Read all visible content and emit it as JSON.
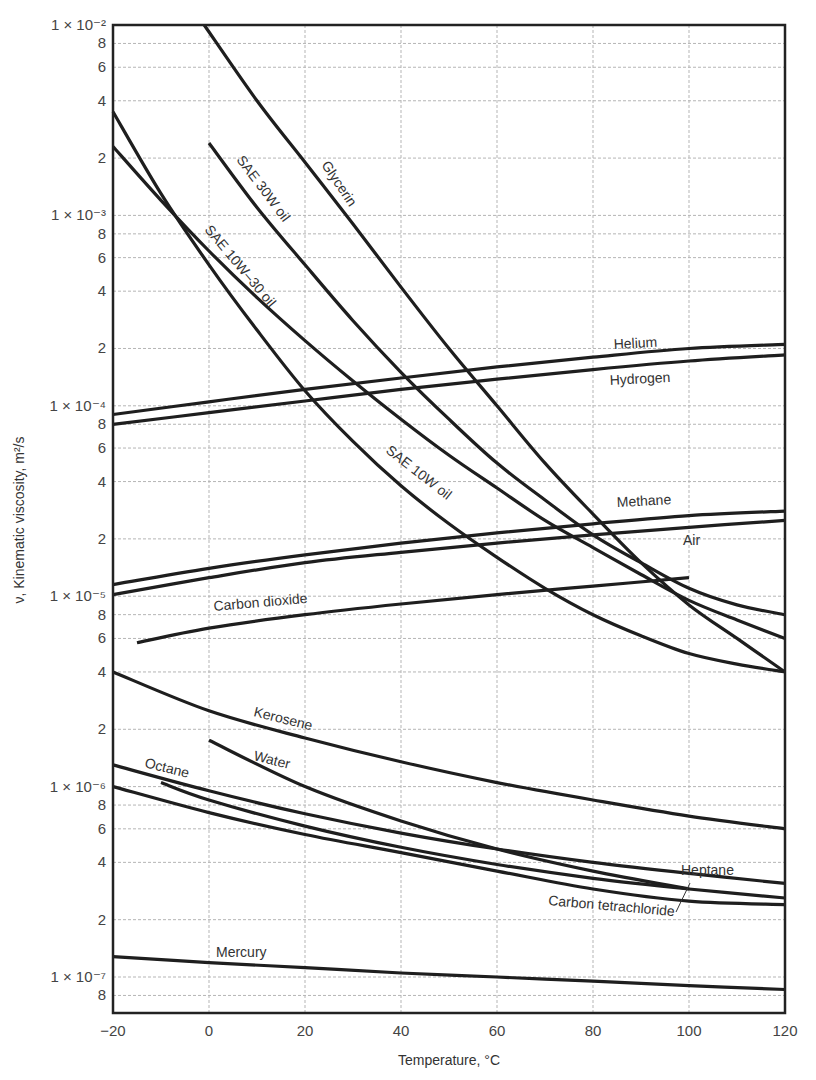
{
  "chart_data": {
    "type": "line",
    "title": "",
    "xlabel": "Temperature, °C",
    "ylabel": "ν, Kinematic viscosity, m²/s",
    "yscale": "log",
    "xlim": [
      -20,
      120
    ],
    "ylim": [
      7e-08,
      0.01
    ],
    "grid": true,
    "legend": "inline labels",
    "x_ticks": [
      -20,
      0,
      20,
      40,
      60,
      80,
      100,
      120
    ],
    "y_ticks": [
      {
        "value": 0.01,
        "label": "1 × 10⁻²"
      },
      {
        "value": 0.008,
        "label": "8"
      },
      {
        "value": 0.006,
        "label": "6"
      },
      {
        "value": 0.004,
        "label": "4"
      },
      {
        "value": 0.002,
        "label": "2"
      },
      {
        "value": 0.001,
        "label": "1 × 10⁻³"
      },
      {
        "value": 0.0008,
        "label": "8"
      },
      {
        "value": 0.0006,
        "label": "6"
      },
      {
        "value": 0.0004,
        "label": "4"
      },
      {
        "value": 0.0002,
        "label": "2"
      },
      {
        "value": 0.0001,
        "label": "1 × 10⁻⁴"
      },
      {
        "value": 8e-05,
        "label": "8"
      },
      {
        "value": 6e-05,
        "label": "6"
      },
      {
        "value": 4e-05,
        "label": "4"
      },
      {
        "value": 2e-05,
        "label": "2"
      },
      {
        "value": 1e-05,
        "label": "1 × 10⁻⁵"
      },
      {
        "value": 8e-06,
        "label": "8"
      },
      {
        "value": 6e-06,
        "label": "6"
      },
      {
        "value": 4e-06,
        "label": "4"
      },
      {
        "value": 2e-06,
        "label": "2"
      },
      {
        "value": 1e-06,
        "label": "1 × 10⁻⁶"
      },
      {
        "value": 8e-07,
        "label": "8"
      },
      {
        "value": 6e-07,
        "label": "6"
      },
      {
        "value": 4e-07,
        "label": "4"
      },
      {
        "value": 2e-07,
        "label": "2"
      },
      {
        "value": 1e-07,
        "label": "1 × 10⁻⁷"
      },
      {
        "value": 8e-08,
        "label": "8"
      }
    ],
    "series": [
      {
        "name": "Glycerin",
        "x": [
          -1,
          10,
          20,
          30,
          40,
          50,
          60,
          70,
          80,
          90,
          100,
          110,
          120
        ],
        "y": [
          0.01,
          0.004,
          0.0019,
          0.0009,
          0.00042,
          0.0002,
          0.0001,
          5e-05,
          2.7e-05,
          1.5e-05,
          9e-06,
          6e-06,
          4e-06
        ]
      },
      {
        "name": "SAE 30W oil",
        "x": [
          0,
          10,
          20,
          30,
          40,
          50,
          60,
          70,
          80,
          90,
          100,
          110,
          120
        ],
        "y": [
          0.0024,
          0.0011,
          0.00055,
          0.00028,
          0.00015,
          8.5e-05,
          5e-05,
          3.2e-05,
          2.1e-05,
          1.5e-05,
          1.1e-05,
          9e-06,
          8e-06
        ]
      },
      {
        "name": "SAE 10W-30 oil",
        "x": [
          -20,
          -10,
          0,
          10,
          20,
          30,
          40,
          50,
          60,
          70,
          80,
          90,
          100,
          110,
          120
        ],
        "y": [
          0.0023,
          0.0012,
          0.00065,
          0.00037,
          0.00022,
          0.000135,
          8.5e-05,
          5.5e-05,
          3.7e-05,
          2.5e-05,
          1.8e-05,
          1.3e-05,
          9.5e-06,
          7.5e-06,
          6e-06
        ]
      },
      {
        "name": "SAE 10W oil",
        "x": [
          -20,
          -10,
          0,
          10,
          20,
          30,
          40,
          50,
          60,
          70,
          80,
          90,
          100,
          110,
          120
        ],
        "y": [
          0.0035,
          0.0013,
          0.00055,
          0.00025,
          0.00012,
          6.5e-05,
          3.8e-05,
          2.4e-05,
          1.6e-05,
          1.1e-05,
          8e-06,
          6.2e-06,
          5e-06,
          4.4e-06,
          4e-06
        ]
      },
      {
        "name": "Helium",
        "x": [
          -20,
          0,
          20,
          40,
          60,
          80,
          100,
          120
        ],
        "y": [
          9e-05,
          0.000105,
          0.000122,
          0.00014,
          0.00016,
          0.00018,
          0.0002,
          0.00021
        ]
      },
      {
        "name": "Hydrogen",
        "x": [
          -20,
          0,
          20,
          40,
          60,
          80,
          100,
          120
        ],
        "y": [
          8e-05,
          9.2e-05,
          0.000106,
          0.000122,
          0.000138,
          0.000155,
          0.000172,
          0.000185
        ]
      },
      {
        "name": "Methane",
        "x": [
          -20,
          0,
          20,
          40,
          60,
          80,
          100,
          120
        ],
        "y": [
          1.15e-05,
          1.4e-05,
          1.65e-05,
          1.9e-05,
          2.15e-05,
          2.4e-05,
          2.65e-05,
          2.8e-05
        ]
      },
      {
        "name": "Air",
        "x": [
          -20,
          0,
          20,
          40,
          60,
          80,
          100,
          120
        ],
        "y": [
          1.02e-05,
          1.25e-05,
          1.5e-05,
          1.7e-05,
          1.9e-05,
          2.1e-05,
          2.3e-05,
          2.5e-05
        ]
      },
      {
        "name": "Carbon dioxide",
        "x": [
          -15,
          0,
          20,
          40,
          60,
          80,
          100
        ],
        "y": [
          5.7e-06,
          6.8e-06,
          8e-06,
          9.1e-06,
          1.02e-05,
          1.13e-05,
          1.25e-05
        ]
      },
      {
        "name": "Kerosene",
        "x": [
          -20,
          0,
          20,
          40,
          60,
          80,
          100,
          120
        ],
        "y": [
          4e-06,
          2.5e-06,
          1.8e-06,
          1.35e-06,
          1.05e-06,
          8.5e-07,
          7e-07,
          6e-07
        ]
      },
      {
        "name": "Water",
        "x": [
          0,
          20,
          40,
          60,
          80,
          100
        ],
        "y": [
          1.75e-06,
          1e-06,
          6.6e-07,
          4.7e-07,
          3.6e-07,
          2.9e-07
        ]
      },
      {
        "name": "Octane",
        "x": [
          -20,
          0,
          20,
          40,
          60,
          80,
          100,
          120
        ],
        "y": [
          1.3e-06,
          9.5e-07,
          7.2e-07,
          5.7e-07,
          4.7e-07,
          4e-07,
          3.5e-07,
          3.1e-07
        ]
      },
      {
        "name": "Heptane",
        "x": [
          -10,
          0,
          20,
          40,
          60,
          80,
          100,
          120
        ],
        "y": [
          1.05e-06,
          8.5e-07,
          6.2e-07,
          4.8e-07,
          3.9e-07,
          3.3e-07,
          2.9e-07,
          2.6e-07
        ]
      },
      {
        "name": "Carbon tetrachloride",
        "x": [
          -20,
          0,
          20,
          40,
          60,
          80,
          100,
          120
        ],
        "y": [
          1e-06,
          7.3e-07,
          5.6e-07,
          4.5e-07,
          3.6e-07,
          2.9e-07,
          2.5e-07,
          2.4e-07
        ]
      },
      {
        "name": "Mercury",
        "x": [
          -20,
          0,
          20,
          40,
          60,
          80,
          100,
          120
        ],
        "y": [
          1.28e-07,
          1.19e-07,
          1.12e-07,
          1.05e-07,
          1e-07,
          9.5e-08,
          9e-08,
          8.6e-08
        ]
      }
    ],
    "annotations": [
      {
        "text": "Glycerin",
        "x": 321,
        "y": 165,
        "rotate": 56
      },
      {
        "text": "SAE 30W oil",
        "x": 236,
        "y": 160,
        "rotate": 53
      },
      {
        "text": "SAE 10W–30 oil",
        "x": 204,
        "y": 230,
        "rotate": 50
      },
      {
        "text": "SAE 10W oil",
        "x": 385,
        "y": 452,
        "rotate": 38
      },
      {
        "text": "Helium",
        "x": 614,
        "y": 349,
        "rotate": -3
      },
      {
        "text": "Hydrogen",
        "x": 610,
        "y": 385,
        "rotate": -3
      },
      {
        "text": "Methane",
        "x": 617,
        "y": 507,
        "rotate": -3
      },
      {
        "text": "Air",
        "x": 683,
        "y": 545,
        "rotate": 0
      },
      {
        "text": "Carbon dioxide",
        "x": 214,
        "y": 611,
        "rotate": -5
      },
      {
        "text": "Kerosene",
        "x": 253,
        "y": 716,
        "rotate": 14
      },
      {
        "text": "Water",
        "x": 253,
        "y": 760,
        "rotate": 14
      },
      {
        "text": "Octane",
        "x": 144,
        "y": 767,
        "rotate": 14
      },
      {
        "text": "Heptane",
        "x": 681,
        "y": 875,
        "rotate": 0
      },
      {
        "text": "Carbon tetrachloride",
        "x": 548,
        "y": 905,
        "rotate": 5
      },
      {
        "text": "Mercury",
        "x": 216,
        "y": 957,
        "rotate": 0
      }
    ]
  },
  "axes": {
    "x_title": "Temperature, °C",
    "y_title": "ν, Kinematic viscosity, m²/s"
  }
}
